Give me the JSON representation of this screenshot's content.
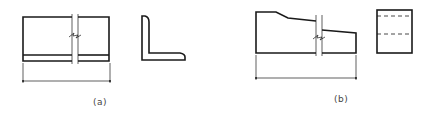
{
  "figure": {
    "panels": [
      {
        "id": "a",
        "label": "(a)",
        "description": "Angle section member: elevation with break lines and dimension line, plus L-shaped cross-section"
      },
      {
        "id": "b",
        "label": "(b)",
        "description": "Tapered member: elevation with sloped top, break lines and dimension line, plus rectangular side view with hidden (dashed) lines"
      }
    ],
    "colors": {
      "line": "#1a1a1a",
      "label": "#444444",
      "background": "#ffffff"
    }
  }
}
